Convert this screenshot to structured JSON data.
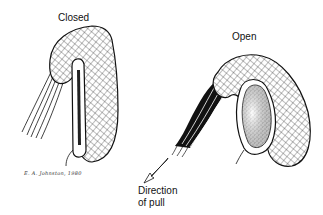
{
  "figure": {
    "panels": [
      {
        "id": "closed",
        "label": "Closed"
      },
      {
        "id": "open",
        "label": "Open"
      }
    ],
    "arrow_label_line1": "Direction",
    "arrow_label_line2": "of pull",
    "signature": "E. A. Johnston, 1980"
  },
  "colors": {
    "ink": "#111111",
    "background": "#ffffff"
  }
}
